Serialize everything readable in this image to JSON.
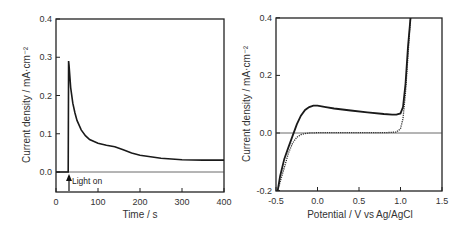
{
  "chart_data": [
    {
      "type": "line",
      "title": "",
      "xlabel": "Time / s",
      "ylabel": "Current density / mA·cm⁻²",
      "xlim": [
        0,
        400
      ],
      "ylim": [
        -0.05,
        0.4
      ],
      "xticks": [
        "0",
        "100",
        "200",
        "300",
        "400"
      ],
      "yticks": [
        "0.0",
        "0.1",
        "0.2",
        "0.3",
        "0.4"
      ],
      "grid": false,
      "annotations": [
        {
          "text": "Light on",
          "x": 30,
          "arrow": "up"
        }
      ],
      "series": [
        {
          "name": "photocurrent",
          "x": [
            0,
            29,
            30,
            31,
            35,
            40,
            45,
            50,
            60,
            70,
            80,
            100,
            120,
            140,
            160,
            180,
            200,
            250,
            300,
            350,
            400
          ],
          "y": [
            0.0,
            0.0,
            0.29,
            0.28,
            0.22,
            0.18,
            0.155,
            0.135,
            0.11,
            0.095,
            0.085,
            0.075,
            0.07,
            0.066,
            0.058,
            0.05,
            0.044,
            0.036,
            0.032,
            0.031,
            0.031
          ]
        }
      ]
    },
    {
      "type": "line",
      "title": "",
      "xlabel": "Potential / V vs Ag/AgCl",
      "ylabel": "Current density / mA·cm⁻²",
      "xlim": [
        -0.5,
        1.5
      ],
      "ylim": [
        -0.2,
        0.4
      ],
      "xticks": [
        "-0.5",
        "0.0",
        "0.5",
        "1.0",
        "1.5"
      ],
      "yticks": [
        "-0.2",
        "0.0",
        "0.2",
        "0.4"
      ],
      "grid": false,
      "series": [
        {
          "name": "light (solid)",
          "x": [
            -0.48,
            -0.45,
            -0.4,
            -0.35,
            -0.3,
            -0.25,
            -0.2,
            -0.15,
            -0.1,
            -0.05,
            0.0,
            0.1,
            0.2,
            0.4,
            0.6,
            0.8,
            0.9,
            0.95,
            1.0,
            1.03,
            1.06,
            1.09,
            1.12
          ],
          "y": [
            -0.2,
            -0.15,
            -0.09,
            -0.05,
            -0.01,
            0.03,
            0.06,
            0.08,
            0.09,
            0.095,
            0.095,
            0.09,
            0.085,
            0.078,
            0.072,
            0.066,
            0.064,
            0.064,
            0.068,
            0.09,
            0.17,
            0.3,
            0.4
          ]
        },
        {
          "name": "dark (dotted)",
          "x": [
            -0.48,
            -0.45,
            -0.4,
            -0.35,
            -0.3,
            -0.25,
            -0.2,
            -0.15,
            -0.1,
            0.0,
            0.2,
            0.5,
            0.8,
            0.95,
            1.0,
            1.03,
            1.06,
            1.09,
            1.12
          ],
          "y": [
            -0.2,
            -0.17,
            -0.12,
            -0.07,
            -0.035,
            -0.015,
            -0.006,
            -0.002,
            0.0,
            0.001,
            0.001,
            0.001,
            0.001,
            0.003,
            0.015,
            0.05,
            0.14,
            0.27,
            0.4
          ]
        }
      ]
    }
  ]
}
